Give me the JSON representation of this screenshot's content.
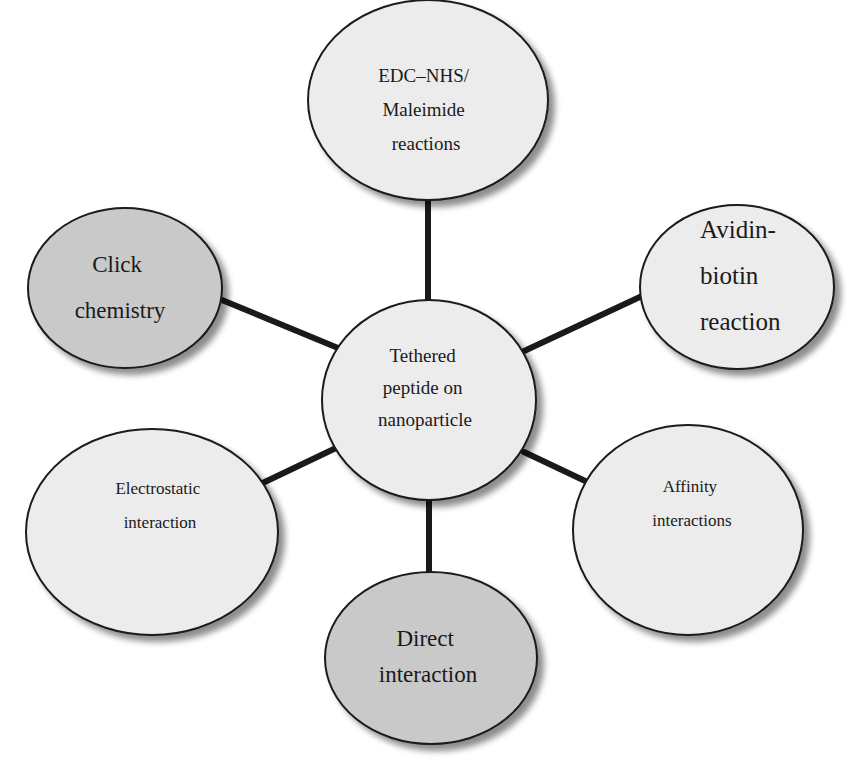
{
  "colors": {
    "light_fill": "#ececec",
    "dark_fill": "#c9c9c9",
    "stroke": "#1a1a1a",
    "connector": "#1a1a1a",
    "shadow": "#9a9a9a"
  },
  "center": {
    "lines": [
      "Tethered",
      "peptide on",
      "nanoparticle"
    ]
  },
  "nodes": [
    {
      "id": "edc-nhs",
      "lines": [
        "EDC–NHS/",
        "Maleimide",
        "reactions"
      ],
      "shade": "light"
    },
    {
      "id": "avidin-biotin",
      "lines": [
        "Avidin-",
        "biotin",
        "reaction"
      ],
      "shade": "light"
    },
    {
      "id": "affinity",
      "lines": [
        "Affinity",
        "interactions"
      ],
      "shade": "light"
    },
    {
      "id": "direct",
      "lines": [
        "Direct",
        "interaction"
      ],
      "shade": "dark"
    },
    {
      "id": "electrostatic",
      "lines": [
        "Electrostatic",
        "interaction"
      ],
      "shade": "light"
    },
    {
      "id": "click",
      "lines": [
        "Click",
        "chemistry"
      ],
      "shade": "dark"
    }
  ]
}
